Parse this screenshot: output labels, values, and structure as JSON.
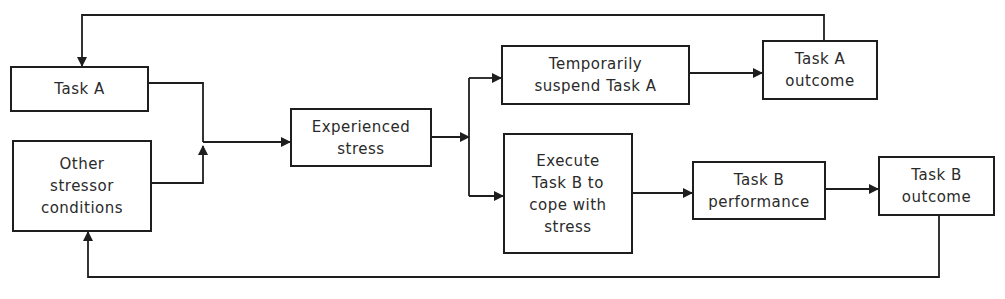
{
  "diagram": {
    "type": "flowchart",
    "colors": {
      "line": "#1e1e1e",
      "text": "#2a2a2a",
      "background": "#ffffff"
    },
    "nodes": {
      "task_a": {
        "label": "Task A"
      },
      "other_stressors": {
        "label": "Other\nstressor\nconditions"
      },
      "experienced_stress": {
        "label": "Experienced\nstress"
      },
      "suspend_task_a": {
        "label": "Temporarily\nsuspend Task A"
      },
      "task_a_outcome": {
        "label": "Task A\noutcome"
      },
      "execute_task_b": {
        "label": "Execute\nTask B to\ncope with\nstress"
      },
      "task_b_performance": {
        "label": "Task B\nperformance"
      },
      "task_b_outcome": {
        "label": "Task B\noutcome"
      }
    },
    "edges": [
      {
        "from": "task_a",
        "to": "experienced_stress"
      },
      {
        "from": "other_stressors",
        "to": "experienced_stress"
      },
      {
        "from": "experienced_stress",
        "to": "suspend_task_a"
      },
      {
        "from": "experienced_stress",
        "to": "execute_task_b"
      },
      {
        "from": "suspend_task_a",
        "to": "task_a_outcome"
      },
      {
        "from": "task_a_outcome",
        "to": "task_a",
        "kind": "feedback"
      },
      {
        "from": "execute_task_b",
        "to": "task_b_performance"
      },
      {
        "from": "task_b_performance",
        "to": "task_b_outcome"
      },
      {
        "from": "task_b_outcome",
        "to": "other_stressors",
        "kind": "feedback"
      }
    ]
  }
}
